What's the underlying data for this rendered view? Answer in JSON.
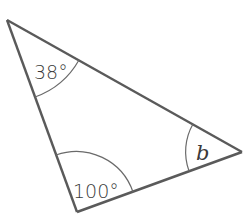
{
  "diagram": {
    "type": "triangle",
    "vertices": {
      "top_left": {
        "x": 7,
        "y": 20
      },
      "bottom": {
        "x": 77,
        "y": 212
      },
      "right": {
        "x": 242,
        "y": 152
      }
    },
    "angles": {
      "top_left": {
        "label": "38°",
        "value": 38
      },
      "bottom": {
        "label": "100°",
        "value": 100
      },
      "right": {
        "label": "b",
        "value": null
      }
    },
    "colors": {
      "stroke": "#5a5a5a",
      "text": "#3a3a3a",
      "background": "#ffffff"
    }
  }
}
